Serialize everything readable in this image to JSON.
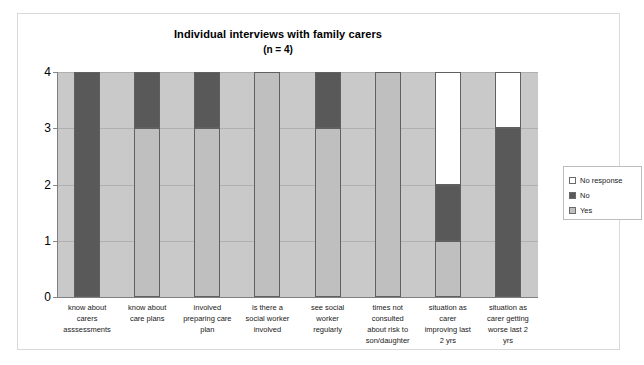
{
  "chart_data": {
    "type": "bar",
    "subtype": "stacked-column",
    "title": "Individual interviews with family carers",
    "subtitle": "(n = 4)",
    "xlabel": "",
    "ylabel": "",
    "ylim": [
      0,
      4
    ],
    "ytick_labels": [
      "4",
      "3",
      "2",
      "1",
      "0"
    ],
    "ytick_values": [
      4,
      3,
      2,
      1,
      0
    ],
    "grid": true,
    "legend_position": "right",
    "categories": [
      "know about carers asssessments",
      "know about care plans",
      "involved preparing care plan",
      "is there a social worker involved",
      "see social worker regularly",
      "times not consulted about risk to son/daughter",
      "situation as carer improving last 2 yrs",
      "situation as carer getting worse last 2 yrs"
    ],
    "category_lines": [
      [
        "know about",
        "carers",
        "asssessments"
      ],
      [
        "know about",
        "care plans"
      ],
      [
        "involved",
        "preparing care",
        "plan"
      ],
      [
        "is there a",
        "social worker",
        "involved"
      ],
      [
        "see social",
        "worker",
        "regularly"
      ],
      [
        "times not",
        "consulted",
        "about risk to",
        "son/daughter"
      ],
      [
        "situation as",
        "carer",
        "improving last",
        "2 yrs"
      ],
      [
        "situation as",
        "carer getting",
        "worse last 2",
        "yrs"
      ]
    ],
    "series": [
      {
        "name": "Yes",
        "color": "#bfbfbf",
        "values": [
          0,
          3,
          3,
          4,
          3,
          4,
          1,
          0
        ]
      },
      {
        "name": "No",
        "color": "#595959",
        "values": [
          4,
          1,
          1,
          0,
          1,
          0,
          1,
          3
        ]
      },
      {
        "name": "No response",
        "color": "#ffffff",
        "values": [
          0,
          0,
          0,
          0,
          0,
          0,
          2,
          1
        ]
      }
    ],
    "stack_order_bottom_to_top": [
      "Yes",
      "No",
      "No response"
    ],
    "total_per_bar": 4,
    "plot_background": "#c9c9c9",
    "canvas_background": "#ffffff"
  },
  "legend": {
    "entries": [
      {
        "label": "No response",
        "color": "#ffffff"
      },
      {
        "label": "No",
        "color": "#595959"
      },
      {
        "label": "Yes",
        "color": "#bfbfbf"
      }
    ]
  }
}
